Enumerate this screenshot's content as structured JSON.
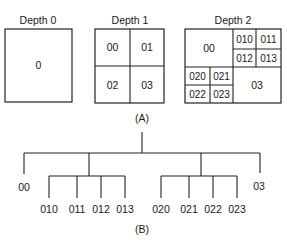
{
  "figure": {
    "part_a": {
      "caption": "(A)",
      "panels": [
        {
          "title": "Depth 0",
          "cells": [
            "0"
          ]
        },
        {
          "title": "Depth 1",
          "cells": [
            "00",
            "01",
            "02",
            "03"
          ]
        },
        {
          "title": "Depth 2",
          "cells": [
            "00",
            "010",
            "011",
            "012",
            "013",
            "020",
            "021",
            "022",
            "023",
            "03"
          ]
        }
      ]
    },
    "part_b": {
      "caption": "(B)",
      "tree": {
        "level1": [
          "00",
          "03"
        ],
        "group_01": [
          "010",
          "011",
          "012",
          "013"
        ],
        "group_02": [
          "020",
          "021",
          "022",
          "023"
        ]
      }
    }
  }
}
